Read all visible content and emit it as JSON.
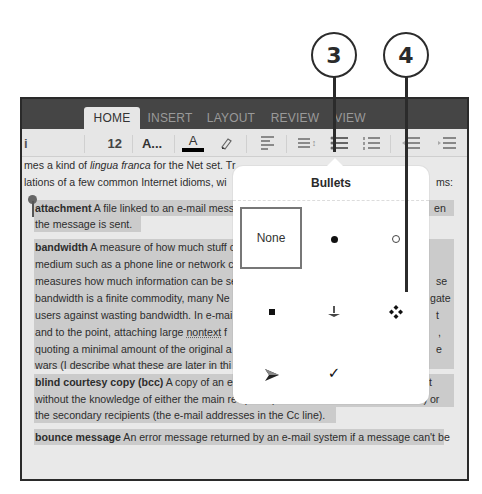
{
  "callouts": [
    {
      "label": "3",
      "target": "bullets-button"
    },
    {
      "label": "4",
      "target": "bullet-style-diamond-option"
    }
  ],
  "tabs": [
    {
      "label": "HOME",
      "active": true
    },
    {
      "label": "INSERT",
      "active": false
    },
    {
      "label": "LAYOUT",
      "active": false
    },
    {
      "label": "REVIEW",
      "active": false
    },
    {
      "label": "VIEW",
      "active": false
    }
  ],
  "toolbar": {
    "font_name_partial": "i",
    "font_size": "12",
    "font_more_label": "A...",
    "font_color_label": "A",
    "font_color_swatch": "#000000",
    "highlight_icon": "highlighter-icon",
    "align_icon": "align-left-icon",
    "line_spacing_icon": "line-spacing-icon",
    "bullets_icon": "bulleted-list-icon",
    "numbering_icon": "numbered-list-icon",
    "decrease_indent_icon": "decrease-indent-icon",
    "increase_indent_icon": "increase-indent-icon"
  },
  "document": {
    "intro_line1_a": "mes a kind of ",
    "intro_line1_italic": "lingua franca",
    "intro_line1_b": " for the Net set. Tr",
    "intro_line2": "lations of a few common Internet idioms, wi",
    "intro_line2_right": "ms:",
    "entries": [
      {
        "term": "attachment",
        "lines": [
          " A file linked to an e-mail mess",
          "the message is sent."
        ],
        "right_fragment": "en"
      },
      {
        "term": "bandwidth",
        "lines": [
          " A measure of how much stuff c",
          "medium such as a phone line or network c",
          "measures how much information can be se",
          "bandwidth is a finite commodity, many Ne",
          "users against wasting bandwidth. In e-mai",
          "and to the point, attaching large ",
          "quoting a minimal amount of the original a",
          "wars (I describe what these are later in thi"
        ],
        "underlined_word": "nontext",
        "line6_tail": " f",
        "right_fragments": [
          "se",
          "gate",
          "t",
          ",",
          "e"
        ]
      },
      {
        "term": "blind courtesy copy (bcc)",
        "lines": [
          " A copy of an e-mail message that gets sent to a recipient",
          "without the knowledge of either the main recipient (the e-mail address in the To line) or",
          "the secondary recipients (the e-mail addresses in the Cc line)."
        ]
      },
      {
        "term": "bounce message",
        "lines": [
          " An error message returned by an e-mail system if a message can't be"
        ]
      }
    ]
  },
  "bullets_popover": {
    "title": "Bullets",
    "options": [
      {
        "name": "none",
        "label": "None",
        "selected": true
      },
      {
        "name": "filled-circle",
        "glyph": "●",
        "selected": false
      },
      {
        "name": "hollow-circle",
        "glyph": "○",
        "selected": false
      },
      {
        "name": "filled-square",
        "glyph": "■",
        "selected": false
      },
      {
        "name": "arrowhead-down",
        "glyph": "⏚",
        "selected": false
      },
      {
        "name": "four-diamond",
        "glyph": "❖",
        "selected": false
      },
      {
        "name": "arrowhead-right",
        "glyph": "➤",
        "selected": false
      },
      {
        "name": "checkmark",
        "glyph": "✓",
        "selected": false
      }
    ]
  }
}
